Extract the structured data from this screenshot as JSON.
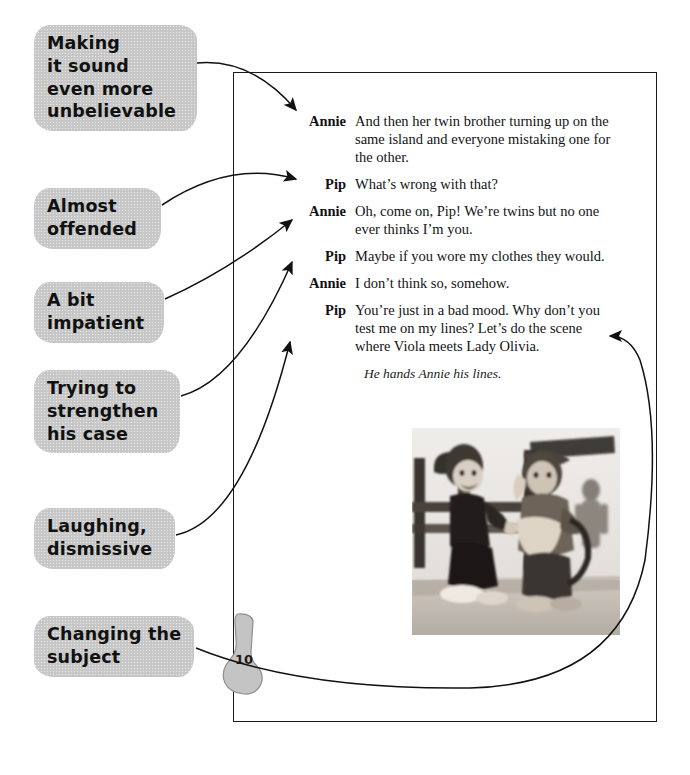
{
  "annotations": {
    "items": [
      {
        "id": "making-it-sound-even-more-unbelievable",
        "lines": [
          "Making",
          "it sound",
          "even more",
          "unbelievable"
        ]
      },
      {
        "id": "almost-offended",
        "lines": [
          "Almost",
          "offended"
        ]
      },
      {
        "id": "a-bit-impatient",
        "lines": [
          "A bit",
          "impatient"
        ]
      },
      {
        "id": "trying-to-strengthen-his-case",
        "lines": [
          "Trying to",
          "strengthen",
          "his case"
        ]
      },
      {
        "id": "laughing-dismissive",
        "lines": [
          "Laughing,",
          "dismissive"
        ]
      },
      {
        "id": "changing-the-subject",
        "lines": [
          "Changing the",
          "subject"
        ]
      }
    ]
  },
  "script": {
    "speeches": [
      {
        "speaker": "Annie",
        "line": "And then her twin brother turning up on the same island and everyone mistaking one for the other."
      },
      {
        "speaker": "Pip",
        "line": "What’s wrong with that?"
      },
      {
        "speaker": "Annie",
        "line": "Oh, come on, Pip! We’re twins but no one ever thinks I’m you."
      },
      {
        "speaker": "Pip",
        "line": "Maybe if you wore my clothes they would."
      },
      {
        "speaker": "Annie",
        "line": "I don’t think so, somehow."
      },
      {
        "speaker": "Pip",
        "line": "You’re just in a bad mood. Why don’t you test me on my lines? Let’s do the scene where Viola meets Lady Olivia."
      }
    ],
    "stage_direction": "He hands Annie his lines."
  },
  "page_marker": {
    "number": "10",
    "shape": "sock-icon"
  },
  "photo": {
    "caption": "two puppet characters on a stage set with wooden fence",
    "alt": "photograph"
  },
  "colors": {
    "callout_background": "#c9c9c9",
    "ink": "#111111",
    "frame": "#1a1a1a",
    "page_background": "#ffffff"
  }
}
